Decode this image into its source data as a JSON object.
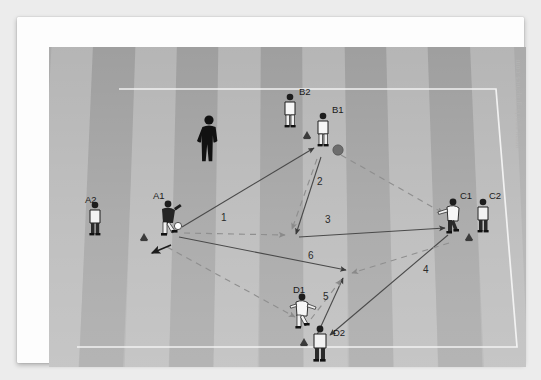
{
  "meta": {
    "watermark": "www.sports-graphics.com"
  },
  "field": {
    "surface_color": "#a8a8a8",
    "stripe_light": "#b4b4b4",
    "stripe_dark": "#9d9d9d",
    "line_color": "#f2f2f2",
    "frame_color": "#ffffff"
  },
  "coach": {
    "label": "",
    "color": "#111111"
  },
  "players": [
    {
      "id": "A2",
      "label": "A2",
      "kit": "dark",
      "x": 46,
      "y": 174,
      "label_x": 36,
      "label_y": 150
    },
    {
      "id": "A1",
      "label": "A1",
      "kit": "dark",
      "x": 118,
      "y": 172,
      "label_x": 104,
      "label_y": 146
    },
    {
      "id": "B2",
      "label": "B2",
      "kit": "light",
      "x": 241,
      "y": 65,
      "label_x": 249,
      "label_y": 53
    },
    {
      "id": "B1",
      "label": "B1",
      "kit": "light",
      "x": 274,
      "y": 83,
      "label_x": 281,
      "label_y": 68
    },
    {
      "id": "C1",
      "label": "C1",
      "kit": "light",
      "x": 404,
      "y": 172,
      "label_x": 410,
      "label_y": 152
    },
    {
      "id": "C2",
      "label": "C2",
      "kit": "dark",
      "x": 434,
      "y": 170,
      "label_x": 438,
      "label_y": 151
    },
    {
      "id": "D1",
      "label": "D1",
      "kit": "light",
      "x": 252,
      "y": 265,
      "label_x": 245,
      "label_y": 246
    },
    {
      "id": "D2",
      "label": "D2",
      "kit": "dark",
      "x": 271,
      "y": 297,
      "label_x": 283,
      "label_y": 289
    }
  ],
  "cones": [
    {
      "near": "A2",
      "x": 95,
      "y": 190
    },
    {
      "near": "B2",
      "x": 258,
      "y": 88
    },
    {
      "near": "C1",
      "x": 420,
      "y": 190
    },
    {
      "near": "D1",
      "x": 255,
      "y": 295
    }
  ],
  "balls": [
    {
      "owner": "B1",
      "x": 289,
      "y": 103,
      "color": "#6a6a6a",
      "style": "grey"
    },
    {
      "owner": "A1",
      "x": 129,
      "y": 179,
      "color": "#ffffff",
      "style": "white"
    }
  ],
  "movements": [
    {
      "number": "1",
      "label_x": 173,
      "label_y": 172,
      "type": "pass",
      "from": "A1",
      "to": "B1"
    },
    {
      "number": "2",
      "label_x": 269,
      "label_y": 136,
      "type": "pass",
      "from": "B1",
      "to": "midfield"
    },
    {
      "number": "3",
      "label_x": 277,
      "label_y": 176,
      "type": "pass",
      "from": "midfield",
      "to": "C1"
    },
    {
      "number": "4",
      "label_x": 373,
      "label_y": 225,
      "type": "pass",
      "from": "C1",
      "to": "D2"
    },
    {
      "number": "5",
      "label_x": 274,
      "label_y": 252,
      "type": "pass",
      "from": "D2",
      "to": "midfield"
    },
    {
      "number": "6",
      "label_x": 260,
      "label_y": 211,
      "type": "pass",
      "from": "A1",
      "to": "midfield"
    }
  ]
}
